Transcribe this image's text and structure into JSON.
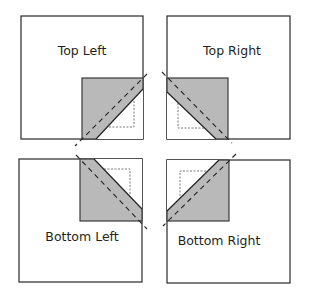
{
  "diagram": {
    "colors": {
      "outline": "#3a3a3a",
      "shade": "#b9b9b9",
      "text": "#231f20",
      "background": "#ffffff"
    },
    "panels": [
      {
        "id": "top-left",
        "label": "Top Left"
      },
      {
        "id": "top-right",
        "label": "Top Right"
      },
      {
        "id": "bottom-left",
        "label": "Bottom Left"
      },
      {
        "id": "bottom-right",
        "label": "Bottom Right"
      }
    ]
  }
}
